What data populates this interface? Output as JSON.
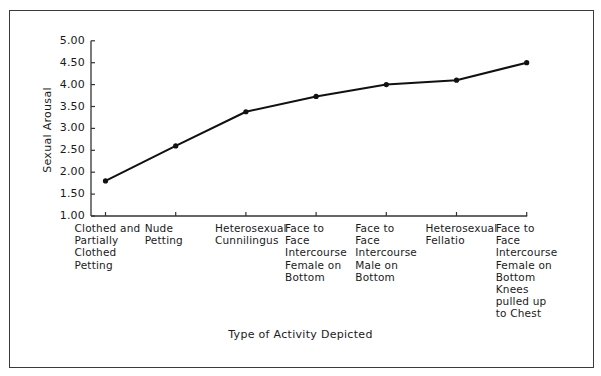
{
  "chart_data": {
    "type": "line",
    "title": "",
    "xlabel": "Type of Activity Depicted",
    "ylabel": "Sexual Arousal",
    "ylim": [
      1.0,
      5.0
    ],
    "yticks": [
      "1.00",
      "1.50",
      "2.00",
      "2.50",
      "3.00",
      "3.50",
      "4.00",
      "4.50",
      "5.00"
    ],
    "grid": false,
    "legend": null,
    "categories": [
      "Clothed and\nPartially\nClothed\nPetting",
      "Nude\nPetting",
      "Heterosexual\nCunnilingus",
      "Face to\nFace\nIntercourse\nFemale on\nBottom",
      "Face to\nFace\nIntercourse\nMale on\nBottom",
      "Heterosexual\nFellatio",
      "Face to\nFace\nIntercourse\nFemale on\nBottom\nKnees\npulled up\nto Chest"
    ],
    "series": [
      {
        "name": "Sexual Arousal",
        "values": [
          1.8,
          2.6,
          3.38,
          3.73,
          4.0,
          4.1,
          4.5
        ]
      }
    ],
    "colors": {
      "line": "#111111",
      "axis": "#333333",
      "text": "#1a1a1a",
      "frame": "#3a3a3a"
    }
  }
}
